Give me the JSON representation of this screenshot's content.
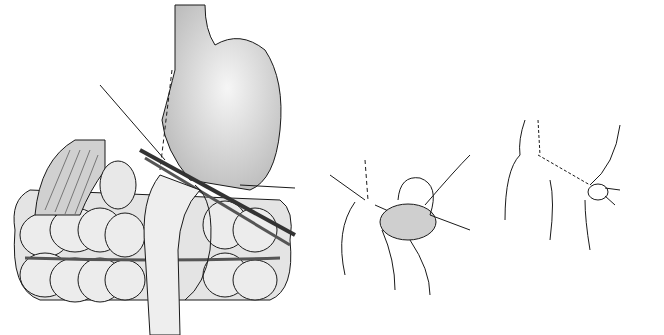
{
  "figure": {
    "type": "medical-illustration",
    "panels": [
      {
        "id": "panel-1",
        "subject": "stomach-with-clamp-and-colon",
        "labels": []
      },
      {
        "id": "panel-2",
        "subject": "anastomosis-in-progress",
        "labels": []
      },
      {
        "id": "panel-3",
        "subject": "completed-anastomosis",
        "labels": []
      }
    ],
    "colors": {
      "background": "#ffffff",
      "line": "#1a1a1a",
      "organ_fill": "#d9d9d9",
      "stomach_highlight": "#f4f4f4",
      "colon_fill": "#e6e6e6"
    }
  }
}
